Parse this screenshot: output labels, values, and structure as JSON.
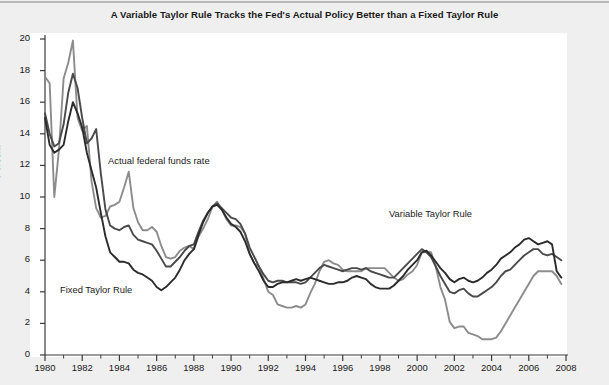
{
  "title": "A Variable Taylor Rule Tracks the Fed's Actual Policy Better than a Fixed Taylor Rule",
  "axes": {
    "ylabel": "Percent",
    "yticks": [
      "0",
      "2",
      "4",
      "6",
      "8",
      "10",
      "12",
      "14",
      "16",
      "18",
      "20"
    ],
    "xticks": [
      "1980",
      "1982",
      "1984",
      "1986",
      "1988",
      "1990",
      "1992",
      "1994",
      "1996",
      "1998",
      "2000",
      "2002",
      "2004",
      "2006",
      "2008"
    ]
  },
  "annotations": {
    "actual": "Actual federal funds rate",
    "fixed": "Fixed Taylor Rule",
    "variable": "Variable Taylor Rule"
  },
  "colors": {
    "actual_line": "#8c8c8c",
    "variable_line": "#4a4a4a",
    "fixed_line": "#2b2b2b",
    "page_background": "#efefef",
    "plot_background": "#ffffff",
    "axis": "#3a3a3a"
  },
  "chart_data": {
    "type": "line",
    "title": "A Variable Taylor Rule Tracks the Fed's Actual Policy Better than a Fixed Taylor Rule",
    "xlabel": "",
    "ylabel": "Percent",
    "xlim": [
      1980,
      2008
    ],
    "ylim": [
      0,
      20
    ],
    "grid": false,
    "legend": "annotations-inline",
    "x": [
      1980.0,
      1980.25,
      1980.5,
      1980.75,
      1981.0,
      1981.25,
      1981.5,
      1981.75,
      1982.0,
      1982.25,
      1982.5,
      1982.75,
      1983.0,
      1983.25,
      1983.5,
      1983.75,
      1984.0,
      1984.25,
      1984.5,
      1984.75,
      1985.0,
      1985.25,
      1985.5,
      1985.75,
      1986.0,
      1986.25,
      1986.5,
      1986.75,
      1987.0,
      1987.25,
      1987.5,
      1987.75,
      1988.0,
      1988.25,
      1988.5,
      1988.75,
      1989.0,
      1989.25,
      1989.5,
      1989.75,
      1990.0,
      1990.25,
      1990.5,
      1990.75,
      1991.0,
      1991.25,
      1991.5,
      1991.75,
      1992.0,
      1992.25,
      1992.5,
      1992.75,
      1993.0,
      1993.25,
      1993.5,
      1993.75,
      1994.0,
      1994.25,
      1994.5,
      1994.75,
      1995.0,
      1995.25,
      1995.5,
      1995.75,
      1996.0,
      1996.25,
      1996.5,
      1996.75,
      1997.0,
      1997.25,
      1997.5,
      1997.75,
      1998.0,
      1998.25,
      1998.5,
      1998.75,
      1999.0,
      1999.25,
      1999.5,
      1999.75,
      2000.0,
      2000.25,
      2000.5,
      2000.75,
      2001.0,
      2001.25,
      2001.5,
      2001.75,
      2002.0,
      2002.25,
      2002.5,
      2002.75,
      2003.0,
      2003.25,
      2003.5,
      2003.75,
      2004.0,
      2004.25,
      2004.5,
      2004.75,
      2005.0,
      2005.25,
      2005.5,
      2005.75,
      2006.0,
      2006.25,
      2006.5,
      2006.75,
      2007.0,
      2007.25,
      2007.5,
      2007.75
    ],
    "series": [
      {
        "name": "Actual federal funds rate",
        "color": "#8c8c8c",
        "values": [
          17.6,
          17.2,
          10.0,
          13.0,
          17.5,
          18.5,
          19.9,
          15.0,
          14.2,
          14.5,
          11.0,
          9.3,
          8.7,
          8.8,
          9.4,
          9.5,
          9.7,
          10.6,
          11.6,
          9.3,
          8.4,
          7.9,
          7.9,
          8.1,
          7.8,
          6.9,
          6.2,
          6.1,
          6.2,
          6.6,
          6.8,
          6.9,
          6.7,
          7.5,
          8.0,
          8.6,
          9.4,
          9.7,
          9.2,
          8.6,
          8.2,
          8.2,
          8.1,
          7.7,
          6.4,
          5.8,
          5.6,
          4.8,
          4.0,
          3.8,
          3.2,
          3.1,
          3.0,
          3.0,
          3.1,
          3.0,
          3.2,
          3.9,
          4.5,
          5.3,
          5.9,
          6.0,
          5.8,
          5.7,
          5.4,
          5.3,
          5.3,
          5.3,
          5.3,
          5.5,
          5.5,
          5.5,
          5.5,
          5.5,
          5.2,
          4.9,
          4.7,
          4.8,
          5.1,
          5.3,
          5.7,
          6.5,
          6.5,
          6.5,
          5.6,
          4.3,
          3.5,
          2.1,
          1.7,
          1.8,
          1.8,
          1.4,
          1.3,
          1.2,
          1.0,
          1.0,
          1.0,
          1.1,
          1.5,
          2.0,
          2.5,
          3.0,
          3.5,
          4.0,
          4.5,
          5.0,
          5.3,
          5.3,
          5.3,
          5.3,
          5.0,
          4.5
        ]
      },
      {
        "name": "Variable Taylor Rule",
        "color": "#4a4a4a",
        "values": [
          15.3,
          14.0,
          13.2,
          13.4,
          14.6,
          16.6,
          17.8,
          16.9,
          15.0,
          13.4,
          13.7,
          14.3,
          11.5,
          9.2,
          8.2,
          8.0,
          7.9,
          8.1,
          8.2,
          7.6,
          7.3,
          7.2,
          7.1,
          7.0,
          6.6,
          6.1,
          5.6,
          5.6,
          5.9,
          6.2,
          6.6,
          6.9,
          7.0,
          7.8,
          8.5,
          9.0,
          9.4,
          9.6,
          9.3,
          9.0,
          8.7,
          8.6,
          8.3,
          7.7,
          6.8,
          6.2,
          5.6,
          5.1,
          4.7,
          4.6,
          4.7,
          4.7,
          4.6,
          4.6,
          4.6,
          4.5,
          4.6,
          4.9,
          5.2,
          5.5,
          5.7,
          5.6,
          5.5,
          5.4,
          5.3,
          5.4,
          5.5,
          5.5,
          5.4,
          5.5,
          5.3,
          5.2,
          5.1,
          5.0,
          4.9,
          4.9,
          5.2,
          5.5,
          5.8,
          6.1,
          6.4,
          6.7,
          6.5,
          6.2,
          5.6,
          5.0,
          4.5,
          4.0,
          3.9,
          4.1,
          4.2,
          3.9,
          3.7,
          3.7,
          3.9,
          4.1,
          4.3,
          4.6,
          5.0,
          5.3,
          5.4,
          5.7,
          6.0,
          6.3,
          6.5,
          6.7,
          6.7,
          6.4,
          6.3,
          6.4,
          6.2,
          6.0
        ]
      },
      {
        "name": "Fixed Taylor Rule",
        "color": "#2b2b2b",
        "values": [
          15.0,
          13.3,
          12.8,
          13.0,
          13.3,
          14.8,
          16.0,
          15.3,
          14.4,
          12.8,
          11.7,
          10.6,
          9.0,
          7.5,
          6.5,
          6.2,
          5.9,
          5.9,
          5.8,
          5.4,
          5.2,
          5.1,
          4.9,
          4.7,
          4.3,
          4.1,
          4.3,
          4.6,
          4.9,
          5.4,
          6.0,
          6.4,
          6.7,
          7.6,
          8.4,
          9.0,
          9.4,
          9.5,
          9.2,
          8.7,
          8.3,
          8.1,
          7.8,
          7.2,
          6.4,
          5.8,
          5.3,
          4.7,
          4.3,
          4.3,
          4.5,
          4.6,
          4.6,
          4.7,
          4.8,
          4.7,
          4.8,
          4.9,
          4.8,
          4.7,
          4.6,
          4.5,
          4.5,
          4.6,
          4.6,
          4.7,
          4.9,
          5.0,
          4.9,
          4.8,
          4.5,
          4.3,
          4.2,
          4.2,
          4.2,
          4.4,
          4.7,
          5.0,
          5.4,
          5.7,
          6.0,
          6.5,
          6.6,
          6.3,
          5.9,
          5.5,
          5.2,
          4.8,
          4.6,
          4.8,
          4.9,
          4.7,
          4.6,
          4.7,
          4.9,
          5.2,
          5.4,
          5.7,
          6.1,
          6.3,
          6.5,
          6.8,
          7.0,
          7.3,
          7.4,
          7.2,
          7.0,
          7.1,
          7.2,
          7.0,
          5.3,
          4.9
        ]
      }
    ]
  }
}
